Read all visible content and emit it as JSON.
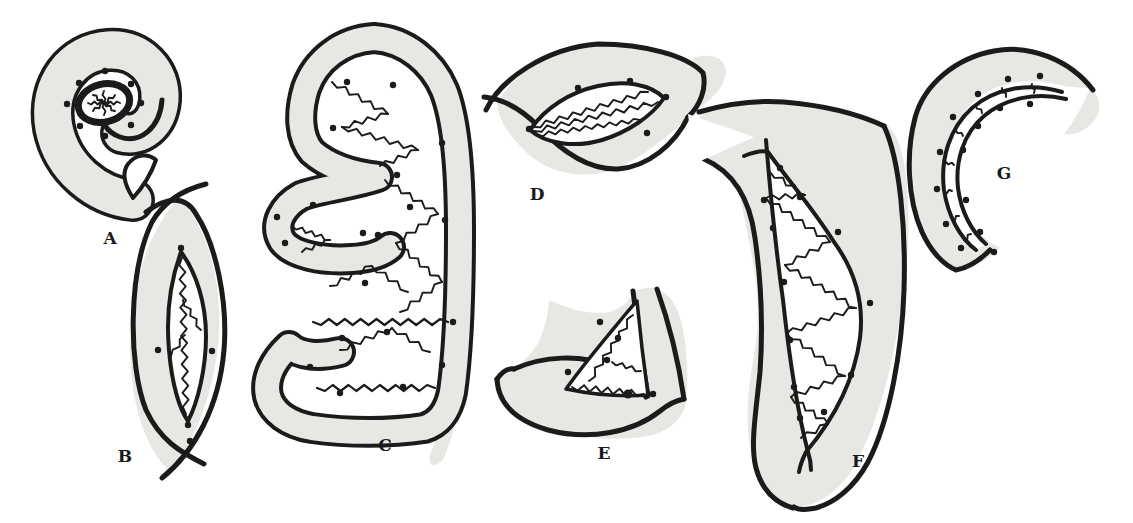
{
  "drawing": {
    "colors": {
      "background": "#ffffff",
      "ink": "#1b1b1b",
      "tone": "#e7e7e3"
    },
    "figures": [
      {
        "label": "A"
      },
      {
        "label": "B"
      },
      {
        "label": "C"
      },
      {
        "label": "D"
      },
      {
        "label": "E"
      },
      {
        "label": "F"
      },
      {
        "label": "G"
      }
    ]
  }
}
